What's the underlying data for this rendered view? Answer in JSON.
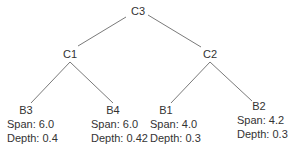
{
  "tree": {
    "root": {
      "id": "C3",
      "label": "C3"
    },
    "internal": [
      {
        "id": "C1",
        "label": "C1",
        "parent": "C3"
      },
      {
        "id": "C2",
        "label": "C2",
        "parent": "C3"
      }
    ],
    "leaves": [
      {
        "id": "B3",
        "label": "B3",
        "parent": "C1",
        "span_label": "Span:",
        "span": "6.0",
        "depth_label": "Depth:",
        "depth": "0.4"
      },
      {
        "id": "B4",
        "label": "B4",
        "parent": "C1",
        "span_label": "Span:",
        "span": "6.0",
        "depth_label": "Depth:",
        "depth": "0.42"
      },
      {
        "id": "B1",
        "label": "B1",
        "parent": "C2",
        "span_label": "Span:",
        "span": "4.0",
        "depth_label": "Depth:",
        "depth": "0.3"
      },
      {
        "id": "B2",
        "label": "B2",
        "parent": "C2",
        "span_label": "Span:",
        "span": "4.2",
        "depth_label": "Depth:",
        "depth": "0.3"
      }
    ]
  },
  "text": {
    "c3": "C3",
    "c1": "C1",
    "c2": "C2",
    "b3": {
      "label": "B3",
      "span": "Span: 6.0",
      "depth": "Depth: 0.4"
    },
    "b4": {
      "label": "B4",
      "span": "Span: 6.0",
      "depth": "Depth: 0.42"
    },
    "b1": {
      "label": "B1",
      "span": "Span: 4.0",
      "depth": "Depth: 0.3"
    },
    "b2": {
      "label": "B2",
      "span": "Span: 4.2",
      "depth": "Depth: 0.3"
    }
  },
  "colors": {
    "edge": "#7a7a7a",
    "text": "#333333",
    "background": "#ffffff"
  }
}
